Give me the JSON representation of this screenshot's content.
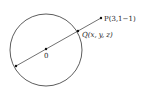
{
  "diagram": {
    "type": "sphere-point-line",
    "circle": {
      "cx": 46,
      "cy": 50,
      "r": 36,
      "stroke": "#333333"
    },
    "points": {
      "P": {
        "label": "P(3,1−1)",
        "x": 101,
        "y": 18
      },
      "Q": {
        "label": "Q(x, y, z)",
        "x": 78,
        "y": 31
      },
      "O": {
        "label": "0",
        "x": 46,
        "y": 50
      },
      "R": {
        "label": "",
        "x": 16,
        "y": 66
      }
    },
    "line_color": "#333333"
  }
}
